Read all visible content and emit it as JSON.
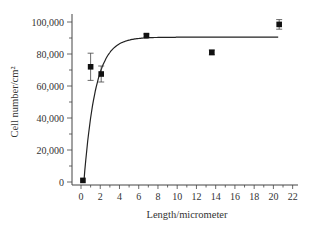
{
  "chart_data": {
    "type": "scatter",
    "title": "",
    "xlabel": "Length/micrometer",
    "ylabel": "Cell number/cm²",
    "xlim": [
      -1,
      22.5
    ],
    "ylim": [
      -2000,
      104000
    ],
    "x_ticks": [
      0,
      2,
      4,
      6,
      8,
      10,
      12,
      14,
      16,
      18,
      20,
      22
    ],
    "x_tick_labels": [
      "0",
      "2",
      "4",
      "6",
      "8",
      "10",
      "12",
      "14",
      "16",
      "18",
      "20",
      "22"
    ],
    "y_ticks": [
      0,
      20000,
      40000,
      60000,
      80000,
      100000
    ],
    "y_tick_labels": [
      "0",
      "20,000",
      "40,000",
      "60,000",
      "80,000",
      "100,000"
    ],
    "grid": false,
    "legend": null,
    "series": [
      {
        "name": "Measured",
        "marker": "square",
        "x": [
          0.2,
          1.0,
          2.1,
          6.8,
          13.6,
          20.6
        ],
        "y": [
          1000,
          72000,
          67500,
          91500,
          81000,
          98500
        ],
        "yerr": [
          0,
          8500,
          5000,
          1000,
          1500,
          3000
        ]
      },
      {
        "name": "Fit",
        "type": "line",
        "model": "y = 90500 * (1 - exp(-(x - 0.3) / 1.2))",
        "x": [
          0.3,
          0.6,
          1.0,
          1.5,
          2.0,
          2.5,
          3.0,
          3.5,
          4.0,
          4.5,
          5.0,
          6.0,
          7.0,
          8.0,
          10.0,
          14.0,
          18.0,
          20.6
        ],
        "y": [
          0,
          20000,
          40000,
          57400,
          68800,
          76000,
          80300,
          83200,
          86300,
          87600,
          88600,
          89700,
          90200,
          90400,
          90500,
          90500,
          90500,
          90500
        ]
      }
    ]
  }
}
